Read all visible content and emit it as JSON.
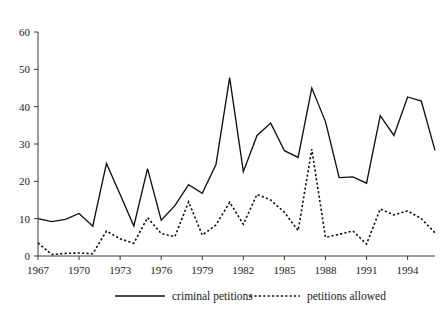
{
  "chart_data": {
    "type": "line",
    "title": "",
    "subtitle": "",
    "xlabel": "",
    "ylabel": "",
    "xlim": [
      1967,
      1996
    ],
    "ylim": [
      0,
      60
    ],
    "grid": false,
    "legend_position": "bottom",
    "x": [
      1967,
      1968,
      1969,
      1970,
      1971,
      1972,
      1973,
      1974,
      1975,
      1976,
      1977,
      1978,
      1979,
      1980,
      1981,
      1982,
      1983,
      1984,
      1985,
      1986,
      1987,
      1988,
      1989,
      1990,
      1991,
      1992,
      1993,
      1994,
      1995,
      1996
    ],
    "xtick_labels": [
      "1967",
      "1970",
      "1973",
      "1976",
      "1979",
      "1982",
      "1985",
      "1988",
      "1991",
      "1994"
    ],
    "xtick_values": [
      1967,
      1970,
      1973,
      1976,
      1979,
      1982,
      1985,
      1988,
      1991,
      1994
    ],
    "ytick_labels": [
      "0",
      "10",
      "20",
      "30",
      "40",
      "50",
      "60"
    ],
    "ytick_values": [
      0,
      10,
      20,
      30,
      40,
      50,
      60
    ],
    "series": [
      {
        "name": "criminal petitions",
        "style": "solid",
        "color": "#111111",
        "values": [
          10.0,
          9.2,
          9.8,
          11.4,
          8.0,
          24.8,
          16.5,
          8.0,
          23.4,
          9.6,
          13.5,
          19.1,
          16.8,
          24.5,
          47.8,
          22.6,
          32.3,
          35.6,
          28.2,
          26.4,
          45.0,
          36.0,
          21.0,
          21.2,
          19.5,
          37.6,
          32.3,
          42.6,
          41.5,
          28.3
        ]
      },
      {
        "name": "petitions allowed",
        "style": "dotted",
        "color": "#111111",
        "values": [
          3.5,
          0.4,
          0.7,
          0.8,
          0.6,
          6.7,
          4.6,
          3.4,
          10.3,
          6.0,
          5.2,
          14.5,
          5.6,
          8.3,
          14.4,
          8.5,
          16.5,
          15.0,
          11.7,
          6.8,
          28.6,
          5.0,
          5.8,
          6.7,
          3.2,
          12.6,
          11.0,
          12.1,
          10.0,
          6.2
        ]
      }
    ],
    "legend": [
      {
        "label": "criminal petitions",
        "style": "solid"
      },
      {
        "label": "petitions allowed",
        "style": "dotted"
      }
    ]
  }
}
